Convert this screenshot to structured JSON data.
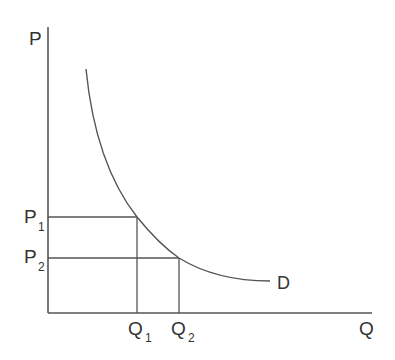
{
  "diagram": {
    "type": "demand-curve",
    "axes": {
      "y_label": "P",
      "x_label": "Q"
    },
    "curve_label": "D",
    "price_levels": [
      {
        "base": "P",
        "sub": "1"
      },
      {
        "base": "P",
        "sub": "2"
      }
    ],
    "quantity_levels": [
      {
        "base": "Q",
        "sub": "1"
      },
      {
        "base": "Q",
        "sub": "2"
      }
    ],
    "line_color": "#555555",
    "text_color": "#333333"
  }
}
